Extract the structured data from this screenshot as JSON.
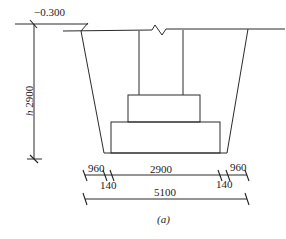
{
  "diagram": {
    "type": "foundation-pit-section",
    "caption": "(a)",
    "elevation": {
      "label": "−0.300"
    },
    "depth": {
      "label": "h 2900",
      "value": 2900
    },
    "dimensions": {
      "row1": [
        {
          "label": "960",
          "value": 960
        },
        {
          "label": "140",
          "value": 140
        },
        {
          "label": "2900",
          "value": 2900
        },
        {
          "label": "140",
          "value": 140
        },
        {
          "label": "960",
          "value": 960
        }
      ],
      "row2": [
        {
          "label": "5100",
          "value": 5100
        }
      ]
    },
    "colors": {
      "line": "#2a2a2a",
      "background": "#ffffff"
    }
  }
}
